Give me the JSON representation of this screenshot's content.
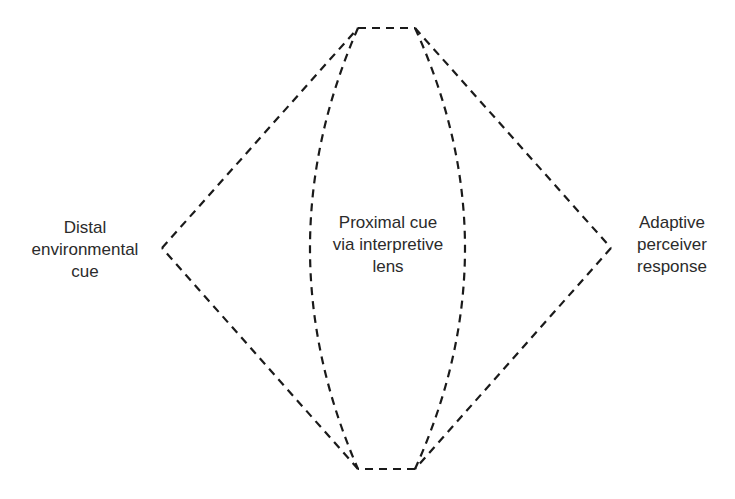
{
  "diagram": {
    "style": {
      "stroke": "#1a1a1a",
      "dash": "8 6",
      "stroke_width": 2.2
    },
    "nodes": {
      "left": {
        "lines": [
          "Distal",
          "environmental",
          "cue"
        ]
      },
      "center": {
        "lines": [
          "Proximal cue",
          "via interpretive",
          "lens"
        ]
      },
      "right": {
        "lines": [
          "Adaptive",
          "perceiver",
          "response"
        ]
      }
    },
    "shape": {
      "left_vertex": [
        162,
        248
      ],
      "right_vertex": [
        611,
        248
      ],
      "top_edge": [
        [
          358,
          28
        ],
        [
          415,
          28
        ]
      ],
      "bottom_edge": [
        [
          358,
          469
        ],
        [
          415,
          469
        ]
      ],
      "lens_left_bulge_x": 310,
      "lens_right_bulge_x": 465
    }
  }
}
